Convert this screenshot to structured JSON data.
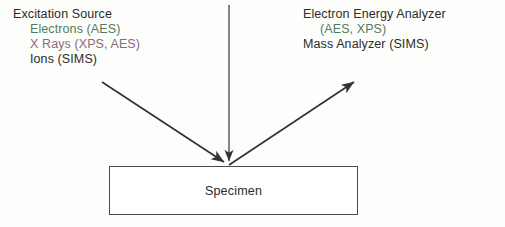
{
  "diagram": {
    "title_visible": false,
    "background_color": "#fdfdfc",
    "ink_color": "#2b2b2b",
    "line_color": "#3b3b43",
    "scan_tint_green": "#4f7d5a",
    "scan_tint_magenta": "#8a6a78"
  },
  "excitation_source": {
    "heading": "Excitation Source",
    "items": [
      "Electrons (AES)",
      "X Rays (XPS, AES)",
      "Ions  (SIMS)"
    ]
  },
  "analyzer": {
    "heading": "Electron Energy Analyzer",
    "sub": "(AES, XPS)",
    "items": [
      "Mass Analyzer (SIMS)"
    ]
  },
  "specimen": {
    "label": "Specimen"
  },
  "arrows": [
    {
      "name": "incident-beam-vertical",
      "x1": 229,
      "y1": 5,
      "x2": 229,
      "y2": 164,
      "head": "end-down"
    },
    {
      "name": "incident-beam-diagonal",
      "x1": 102,
      "y1": 82,
      "x2": 227,
      "y2": 164,
      "head": "end"
    },
    {
      "name": "emitted-beam-diagonal",
      "x1": 229,
      "y1": 165,
      "x2": 357,
      "y2": 80,
      "head": "end"
    }
  ]
}
